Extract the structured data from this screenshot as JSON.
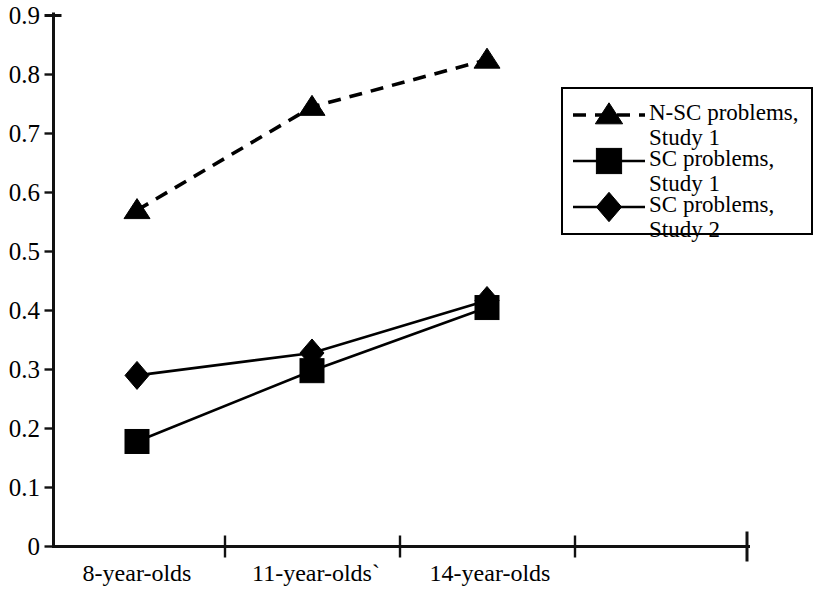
{
  "chart_data": {
    "type": "line",
    "title": "",
    "subtitle": "",
    "xlabel": "",
    "ylabel": "",
    "categories": [
      "8-year-olds",
      "11-year-olds`",
      "14-year-olds"
    ],
    "ylim": [
      0,
      0.9
    ],
    "ytick_labels": [
      "0.9",
      "0.8",
      "0.7",
      "0.6",
      "0.5",
      "0.4",
      "0.3",
      "0.2",
      "0.1",
      "0"
    ],
    "ytick_values": [
      0.9,
      0.8,
      0.7,
      0.6,
      0.5,
      0.4,
      0.3,
      0.2,
      0.1,
      0
    ],
    "grid": false,
    "legend_position": "right-top",
    "series": [
      {
        "name": "N-SC problems, Study 1",
        "name_line1": "N-SC problems,",
        "name_line2": "Study 1",
        "marker": "triangle",
        "linestyle": "dashed",
        "color": "#000000",
        "values": [
          0.57,
          0.745,
          0.825
        ]
      },
      {
        "name": "SC problems, Study 1",
        "name_line1": "SC problems,",
        "name_line2": "Study 1",
        "marker": "square",
        "linestyle": "solid",
        "color": "#000000",
        "values": [
          0.178,
          0.298,
          0.405
        ]
      },
      {
        "name": "SC problems, Study 2",
        "name_line1": "SC problems,",
        "name_line2": "Study 2",
        "marker": "diamond",
        "linestyle": "solid",
        "color": "#000000",
        "values": [
          0.29,
          0.328,
          0.417
        ]
      }
    ]
  },
  "axes": {
    "y_labels": [
      "0.9",
      "0.8",
      "0.7",
      "0.6",
      "0.5",
      "0.4",
      "0.3",
      "0.2",
      "0.1",
      "0"
    ],
    "x_labels": [
      "8-year-olds",
      "11-year-olds`",
      "14-year-olds"
    ]
  },
  "legend": {
    "entries": [
      {
        "line1": "N-SC problems,",
        "line2": "Study 1"
      },
      {
        "line1": "SC problems,",
        "line2": "Study 1"
      },
      {
        "line1": "SC problems,",
        "line2": "Study 2"
      }
    ]
  }
}
